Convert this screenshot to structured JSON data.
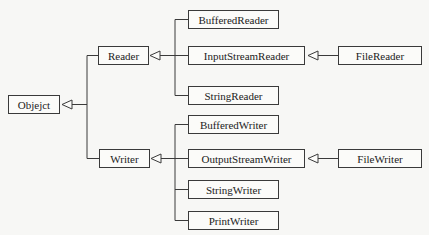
{
  "diagram": {
    "type": "class-hierarchy",
    "root": {
      "id": "object",
      "label": "Objejct"
    },
    "nodes": [
      {
        "id": "object",
        "label": "Objejct",
        "x": 8,
        "y": 95,
        "w": 52,
        "h": 19
      },
      {
        "id": "reader",
        "label": "Reader",
        "x": 98,
        "y": 46,
        "w": 51,
        "h": 19
      },
      {
        "id": "writer",
        "label": "Writer",
        "x": 99,
        "y": 149,
        "w": 51,
        "h": 19
      },
      {
        "id": "bufferedreader",
        "label": "BufferedReader",
        "x": 188,
        "y": 10,
        "w": 91,
        "h": 19
      },
      {
        "id": "inputstreamreader",
        "label": "InputStreamReader",
        "x": 188,
        "y": 46,
        "w": 117,
        "h": 19
      },
      {
        "id": "stringreader",
        "label": "StringReader",
        "x": 188,
        "y": 86,
        "w": 91,
        "h": 19
      },
      {
        "id": "filereader",
        "label": "FileReader",
        "x": 338,
        "y": 46,
        "w": 84,
        "h": 19
      },
      {
        "id": "bufferedwriter",
        "label": "BufferedWriter",
        "x": 188,
        "y": 115,
        "w": 91,
        "h": 19
      },
      {
        "id": "outputstreamwriter",
        "label": "OutputStreamWriter",
        "x": 188,
        "y": 149,
        "w": 117,
        "h": 19
      },
      {
        "id": "stringwriter",
        "label": "StringWriter",
        "x": 188,
        "y": 180,
        "w": 91,
        "h": 19
      },
      {
        "id": "printwriter",
        "label": "PrintWriter",
        "x": 188,
        "y": 211,
        "w": 91,
        "h": 19
      },
      {
        "id": "filewriter",
        "label": "FileWriter",
        "x": 338,
        "y": 149,
        "w": 84,
        "h": 19
      }
    ],
    "edges": [
      {
        "from": "reader",
        "to": "object",
        "kind": "inheritance"
      },
      {
        "from": "writer",
        "to": "object",
        "kind": "inheritance"
      },
      {
        "from": "bufferedreader",
        "to": "reader",
        "kind": "inheritance"
      },
      {
        "from": "inputstreamreader",
        "to": "reader",
        "kind": "inheritance"
      },
      {
        "from": "stringreader",
        "to": "reader",
        "kind": "inheritance"
      },
      {
        "from": "filereader",
        "to": "inputstreamreader",
        "kind": "inheritance"
      },
      {
        "from": "bufferedwriter",
        "to": "writer",
        "kind": "inheritance"
      },
      {
        "from": "outputstreamwriter",
        "to": "writer",
        "kind": "inheritance"
      },
      {
        "from": "stringwriter",
        "to": "writer",
        "kind": "inheritance"
      },
      {
        "from": "printwriter",
        "to": "writer",
        "kind": "inheritance"
      },
      {
        "from": "filewriter",
        "to": "outputstreamwriter",
        "kind": "inheritance"
      }
    ],
    "colors": {
      "line": "#3a3a3a",
      "box_fill": "#fbfbf9",
      "background": "#f7f7f5"
    }
  },
  "labels": {
    "object": "Objejct",
    "reader": "Reader",
    "writer": "Writer",
    "bufferedreader": "BufferedReader",
    "inputstreamreader": "InputStreamReader",
    "stringreader": "StringReader",
    "filereader": "FileReader",
    "bufferedwriter": "BufferedWriter",
    "outputstreamwriter": "OutputStreamWriter",
    "stringwriter": "StringWriter",
    "printwriter": "PrintWriter",
    "filewriter": "FileWriter"
  }
}
